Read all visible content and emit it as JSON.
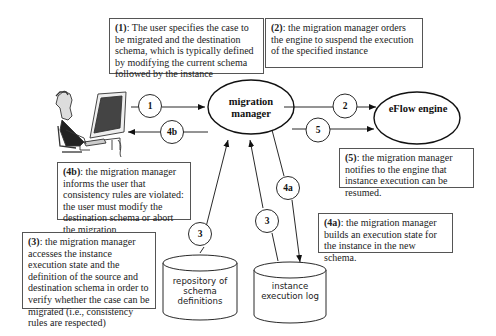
{
  "nodes": {
    "migration_manager": {
      "label_line1": "migration",
      "label_line2": "manager"
    },
    "eflow_engine": {
      "label": "eFlow engine"
    },
    "repository": {
      "label_line1": "repository of",
      "label_line2": "schema",
      "label_line3": "definitions"
    },
    "execution_log": {
      "label_line1": "instance",
      "label_line2": "execution log"
    },
    "user": {
      "label": "user at computer"
    }
  },
  "edges": {
    "e1": {
      "label": "1",
      "from": "user",
      "to": "migration manager"
    },
    "e4b": {
      "label": "4b",
      "from": "migration manager",
      "to": "user"
    },
    "e2": {
      "label": "2",
      "from": "migration manager",
      "to": "eFlow engine"
    },
    "e5": {
      "label": "5",
      "from": "migration manager",
      "to": "eFlow engine"
    },
    "e3_repo": {
      "label": "3",
      "from": "repository of schema definitions",
      "to": "migration manager"
    },
    "e3_log": {
      "label": "3",
      "from": "instance execution log",
      "to": "migration manager"
    },
    "e4a": {
      "label": "4a",
      "from": "migration manager",
      "to": "instance execution log"
    }
  },
  "notes": {
    "n1": {
      "tag": "(1)",
      "text": ": The user specifies the case to be migrated and the destination schema, which is typically defined by modifying the current schema followed by the instance"
    },
    "n2": {
      "tag": "(2)",
      "text": ": the migration manager orders the engine to suspend the execution of the specified instance"
    },
    "n4b": {
      "tag": "(4b)",
      "text": ": the migration manager informs the user that consistency rules are violated: the user must modify the destination schema or abort the migration"
    },
    "n5": {
      "tag": "(5)",
      "text": ": the migration manager notifies to the engine that instance execution can be resumed."
    },
    "n3": {
      "tag": "(3)",
      "text": ": the migration manager accesses the instance execution state and the definition of the source and destination schema in order to verify whether the case can be migrated (i.e., consistency rules are respected)"
    },
    "n4a": {
      "tag": "(4a)",
      "text": ": the migration manager builds an execution state for the instance in the new schema."
    }
  }
}
